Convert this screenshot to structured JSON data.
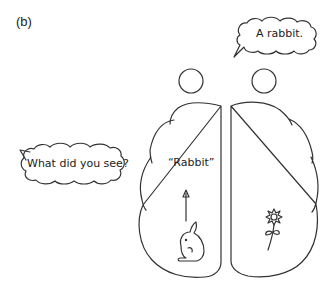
{
  "panel_label": "(b)",
  "speech_right": "A rabbit.",
  "speech_left": "What did you see?",
  "left_hemisphere_word": "“Rabbit”",
  "icons": {
    "left_hemisphere": "rabbit-icon",
    "right_hemisphere": "flower-icon"
  },
  "colors": {
    "stroke": "#333333",
    "background": "#ffffff"
  }
}
